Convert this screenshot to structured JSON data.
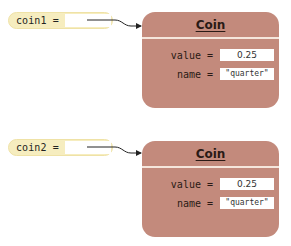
{
  "diagram": {
    "type": "object-reference-diagram",
    "colors": {
      "variable_fill": "#f6edbf",
      "object_fill": "#c38a7c",
      "slot_fill": "#ffffff",
      "arrow": "#222222"
    },
    "variables": [
      {
        "label": "coin1 =",
        "points_to": 0
      },
      {
        "label": "coin2 =",
        "points_to": 1
      }
    ],
    "objects": [
      {
        "class_name": "Coin",
        "fields": [
          {
            "label": "value =",
            "value": "0.25"
          },
          {
            "label": "name =",
            "value": "\"quarter\""
          }
        ]
      },
      {
        "class_name": "Coin",
        "fields": [
          {
            "label": "value =",
            "value": "0.25"
          },
          {
            "label": "name =",
            "value": "\"quarter\""
          }
        ]
      }
    ]
  }
}
